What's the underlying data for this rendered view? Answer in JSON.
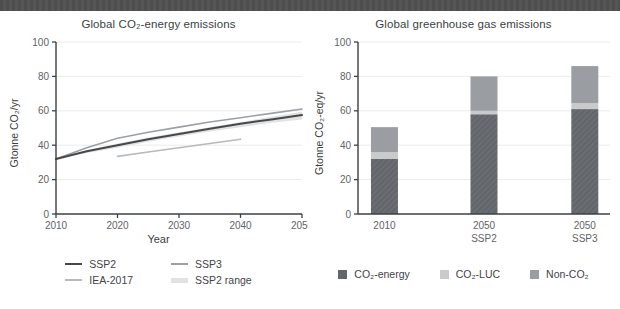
{
  "page": {
    "background": "#ffffff",
    "header_strip_color": "#4f4f4f"
  },
  "chart_data": [
    {
      "type": "line",
      "title": "Global CO₂-energy emissions",
      "xlabel": "Year",
      "ylabel": "Gtonne CO₂/yr",
      "xlim": [
        2010,
        2050
      ],
      "ylim": [
        0,
        100
      ],
      "xticks": [
        2010,
        2020,
        2030,
        2040,
        2050
      ],
      "yticks": [
        0,
        20,
        40,
        60,
        80,
        100
      ],
      "grid": true,
      "legend_position": "bottom",
      "legend_order": [
        "SSP2",
        "SSP3",
        "IEA-2017",
        "SSP2 range"
      ],
      "series": [
        {
          "name": "SSP2 range",
          "band": true,
          "color": "#e2e2e2",
          "x": [
            2010,
            2015,
            2020,
            2025,
            2030,
            2035,
            2040,
            2045,
            2050
          ],
          "lower": [
            32,
            35.5,
            38.5,
            42,
            45,
            48,
            50.5,
            53,
            55
          ],
          "upper": [
            32,
            37,
            41,
            44.5,
            47.5,
            50.5,
            53.5,
            56.5,
            59.5
          ]
        },
        {
          "name": "SSP3",
          "color": "#9ba0a5",
          "stroke_width": 1.6,
          "x": [
            2010,
            2015,
            2020,
            2025,
            2030,
            2035,
            2040,
            2045,
            2050
          ],
          "y": [
            32,
            38.5,
            44,
            47.5,
            50.5,
            53.5,
            56,
            58.5,
            61
          ]
        },
        {
          "name": "SSP2",
          "color": "#46494c",
          "stroke_width": 2,
          "x": [
            2010,
            2015,
            2020,
            2025,
            2030,
            2035,
            2040,
            2045,
            2050
          ],
          "y": [
            32,
            36.5,
            40,
            43.5,
            46.5,
            49.5,
            52.5,
            55,
            57.5
          ]
        },
        {
          "name": "IEA-2017",
          "color": "#b6babd",
          "stroke_width": 1.6,
          "x": [
            2020,
            2025,
            2030,
            2035,
            2040
          ],
          "y": [
            33.5,
            36,
            38.5,
            41,
            43.5
          ]
        }
      ]
    },
    {
      "type": "bar",
      "stacked": true,
      "title": "Global greenhouse gas emissions",
      "ylabel": "Gtonne CO₂-eq/yr",
      "ylim": [
        0,
        100
      ],
      "yticks": [
        0,
        20,
        40,
        60,
        80,
        100
      ],
      "grid": true,
      "legend_position": "bottom",
      "categories": [
        [
          "2010"
        ],
        [
          "2050",
          "SSP2"
        ],
        [
          "2050",
          "SSP3"
        ]
      ],
      "series": [
        {
          "name": "CO₂-energy",
          "values": [
            32,
            58,
            61
          ],
          "color": "#63676c"
        },
        {
          "name": "CO₂-LUC",
          "values": [
            4,
            2,
            3.5
          ],
          "color": "#c9cacc"
        },
        {
          "name": "Non-CO₂",
          "values": [
            14.5,
            20,
            21.5
          ],
          "color": "#9a9ea3"
        }
      ]
    }
  ]
}
